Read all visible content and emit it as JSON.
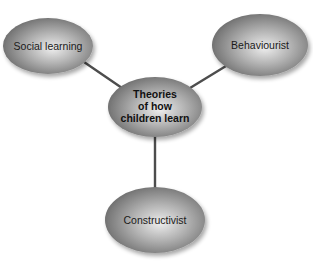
{
  "diagram": {
    "type": "concept-map",
    "colors": {
      "node_light": "#e8e8e8",
      "node_mid": "#a4a4a4",
      "node_dark": "#6a6a6a",
      "connector": "#4d4d4d",
      "text": "#1a1a1a"
    },
    "center": {
      "lines": [
        "Theories",
        "of how",
        "children learn"
      ]
    },
    "nodes": [
      {
        "id": "social-learning",
        "label": "Social learning"
      },
      {
        "id": "behaviourist",
        "label": "Behaviourist"
      },
      {
        "id": "constructivist",
        "label": "Constructivist"
      }
    ]
  }
}
